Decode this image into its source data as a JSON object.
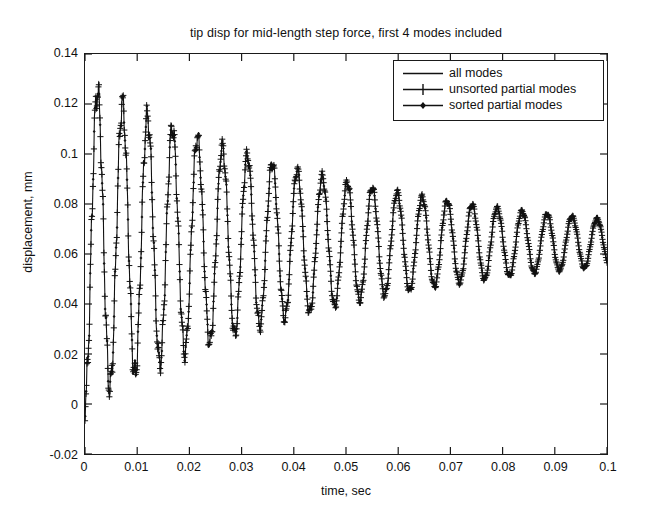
{
  "chart_data": {
    "type": "line",
    "title": "tip disp for mid-length step force, first 4 modes included",
    "xlabel": "time, sec",
    "ylabel": "displacement, mm",
    "xlim": [
      0,
      0.1
    ],
    "ylim": [
      -0.02,
      0.14
    ],
    "xticks": [
      0,
      0.01,
      0.02,
      0.03,
      0.04,
      0.05,
      0.06,
      0.07,
      0.08,
      0.09,
      0.1
    ],
    "xtick_labels": [
      "0",
      "0.01",
      "0.02",
      "0.03",
      "0.04",
      "0.05",
      "0.06",
      "0.07",
      "0.08",
      "0.09",
      "0.1"
    ],
    "yticks": [
      -0.02,
      0,
      0.02,
      0.04,
      0.06,
      0.08,
      0.1,
      0.12,
      0.14
    ],
    "ytick_labels": [
      "-0.02",
      "0",
      "0.02",
      "0.04",
      "0.06",
      "0.08",
      "0.1",
      "0.12",
      "0.14"
    ],
    "grid": false,
    "legend_position": "upper right",
    "series": [
      {
        "name": "all modes",
        "marker": "none",
        "color": "#111111",
        "model": {
          "kind": "damped_step_response",
          "steady_state": 0.0645,
          "amplitude": 0.0635,
          "freq_hz": 209,
          "damping_tau": 0.052,
          "ripple_amp": 0.0055,
          "ripple_freq_hz": 1310,
          "ripple_tau": 0.038,
          "ripple2_amp": 0.0022,
          "ripple2_freq_hz": 3600,
          "ripple2_tau": 0.03
        }
      },
      {
        "name": "unsorted partial modes",
        "marker": "plus",
        "color": "#111111",
        "model": {
          "kind": "damped_step_response",
          "steady_state": 0.0645,
          "amplitude": 0.0635,
          "freq_hz": 209,
          "damping_tau": 0.052,
          "ripple_amp": 0.0055,
          "ripple_freq_hz": 1310,
          "ripple_tau": 0.038,
          "ripple2_amp": 0.0022,
          "ripple2_freq_hz": 3600,
          "ripple2_tau": 0.03
        }
      },
      {
        "name": "sorted partial modes",
        "marker": "diamond",
        "color": "#111111",
        "model": {
          "kind": "damped_step_response",
          "steady_state": 0.0645,
          "amplitude": 0.0635,
          "freq_hz": 209,
          "damping_tau": 0.052,
          "ripple_amp": 0.0055,
          "ripple_freq_hz": 1310,
          "ripple_tau": 0.038,
          "ripple2_amp": 0.0022,
          "ripple2_freq_hz": 3600,
          "ripple2_tau": 0.03
        }
      }
    ],
    "annotations": {
      "peak_values": [
        0.127,
        0.118,
        0.111,
        0.1045,
        0.0995,
        0.0945,
        0.091,
        0.0875,
        0.0845,
        0.082,
        0.08,
        0.0785,
        0.0772,
        0.0758,
        0.0748,
        0.074,
        0.0733,
        0.0727,
        0.0722,
        0.0718,
        0.0714
      ],
      "trough_values": [
        0.0,
        0.0085,
        0.0145,
        0.0205,
        0.0255,
        0.03,
        0.034,
        0.0375,
        0.0405,
        0.0432,
        0.0455,
        0.0475,
        0.0492,
        0.0507,
        0.0518,
        0.0528,
        0.0537,
        0.0544,
        0.055,
        0.0555,
        0.056
      ],
      "start_value": 0.0,
      "end_value": 0.056
    }
  }
}
